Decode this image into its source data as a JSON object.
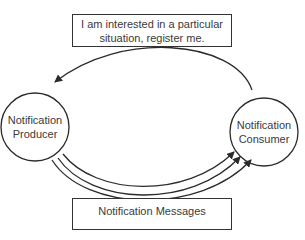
{
  "diagram": {
    "register_box": {
      "line1": "I am interested in a particular",
      "line2": "situation, register me."
    },
    "producer": {
      "line1": "Notification",
      "line2": "Producer"
    },
    "consumer": {
      "line1": "Notification",
      "line2": "Consumer"
    },
    "messages_box": {
      "label": "Notification Messages"
    },
    "colors": {
      "stroke": "#2b2b2b",
      "text": "#3a3a3a",
      "background": "#ffffff"
    }
  }
}
